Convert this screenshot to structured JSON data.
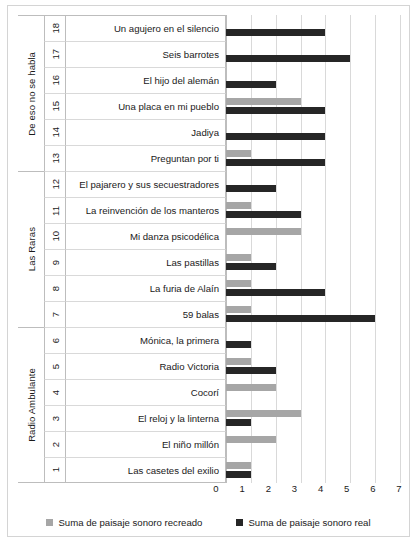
{
  "chart_data": {
    "type": "bar",
    "orientation": "horizontal",
    "title": "",
    "xlabel": "",
    "ylabel": "",
    "xlim": [
      0,
      7
    ],
    "xticks": [
      0,
      1,
      2,
      3,
      4,
      5,
      6,
      7
    ],
    "grid": true,
    "legend_position": "bottom",
    "legend": [
      "Suma de paisaje sonoro recreado",
      "Suma de paisaje sonoro real"
    ],
    "colors": {
      "recreado": "#a6a6a6",
      "real": "#262626",
      "grid": "#d9d9d9",
      "border": "#bdbdbd",
      "background": "#ffffff",
      "text": "#1a1a1a"
    },
    "series": [
      {
        "name": "Suma de paisaje sonoro recreado",
        "color": "#a6a6a6",
        "values": [
          1,
          2,
          3,
          2,
          1,
          0,
          1,
          1,
          1,
          3,
          1,
          0,
          1,
          0,
          3,
          0,
          0,
          0
        ]
      },
      {
        "name": "Suma de paisaje sonoro real",
        "color": "#262626",
        "values": [
          1,
          0,
          1,
          0,
          2,
          1,
          6,
          4,
          2,
          0,
          3,
          2,
          4,
          4,
          4,
          2,
          5,
          4
        ]
      }
    ],
    "categories": [
      "Las casetes del exilio",
      "El niño millón",
      "El reloj y la linterna",
      "Cocorí",
      "Radio Victoria",
      "Mónica, la primera",
      "59 balas",
      "La furia de Alaín",
      "Las pastillas",
      "Mi danza psicodélica",
      "La reinvención de los manteros",
      "El pajarero y sus secuestradores",
      "Preguntan por ti",
      "Jadiya",
      "Una placa en mi pueblo",
      "El hijo del alemán",
      "Seis barrotes",
      "Un agujero en el silencio"
    ],
    "numbers": [
      1,
      2,
      3,
      4,
      5,
      6,
      7,
      8,
      9,
      10,
      11,
      12,
      13,
      14,
      15,
      16,
      17,
      18
    ],
    "groups": [
      {
        "label": "De eso no se habla",
        "start_number": 13,
        "end_number": 18
      },
      {
        "label": "Las Raras",
        "start_number": 7,
        "end_number": 12
      },
      {
        "label": "Radio Ambulante",
        "start_number": 1,
        "end_number": 6
      }
    ]
  },
  "rows": [
    {
      "number": "18",
      "category": "Un agujero en el silencio",
      "recreado": 0,
      "real": 4,
      "group": "De eso no se habla"
    },
    {
      "number": "17",
      "category": "Seis barrotes",
      "recreado": 0,
      "real": 5,
      "group": "De eso no se habla"
    },
    {
      "number": "16",
      "category": "El hijo del alemán",
      "recreado": 0,
      "real": 2,
      "group": "De eso no se habla"
    },
    {
      "number": "15",
      "category": "Una placa en mi pueblo",
      "recreado": 3,
      "real": 4,
      "group": "De eso no se habla"
    },
    {
      "number": "14",
      "category": "Jadiya",
      "recreado": 0,
      "real": 4,
      "group": "De eso no se habla"
    },
    {
      "number": "13",
      "category": "Preguntan por ti",
      "recreado": 1,
      "real": 4,
      "group": "De eso no se habla"
    },
    {
      "number": "12",
      "category": "El pajarero y sus secuestradores",
      "recreado": 0,
      "real": 2,
      "group": "Las Raras"
    },
    {
      "number": "11",
      "category": "La reinvención de los manteros",
      "recreado": 1,
      "real": 3,
      "group": "Las Raras"
    },
    {
      "number": "10",
      "category": "Mi danza psicodélica",
      "recreado": 3,
      "real": 0,
      "group": "Las Raras"
    },
    {
      "number": "9",
      "category": "Las pastillas",
      "recreado": 1,
      "real": 2,
      "group": "Las Raras"
    },
    {
      "number": "8",
      "category": "La furia de Alaín",
      "recreado": 1,
      "real": 4,
      "group": "Las Raras"
    },
    {
      "number": "7",
      "category": "59 balas",
      "recreado": 1,
      "real": 6,
      "group": "Las Raras"
    },
    {
      "number": "6",
      "category": "Mónica, la primera",
      "recreado": 0,
      "real": 1,
      "group": "Radio Ambulante"
    },
    {
      "number": "5",
      "category": "Radio Victoria",
      "recreado": 1,
      "real": 2,
      "group": "Radio Ambulante"
    },
    {
      "number": "4",
      "category": "Cocorí",
      "recreado": 2,
      "real": 0,
      "group": "Radio Ambulante"
    },
    {
      "number": "3",
      "category": "El reloj y la linterna",
      "recreado": 3,
      "real": 1,
      "group": "Radio Ambulante"
    },
    {
      "number": "2",
      "category": "El niño millón",
      "recreado": 2,
      "real": 0,
      "group": "Radio Ambulante"
    },
    {
      "number": "1",
      "category": "Las casetes del exilio",
      "recreado": 1,
      "real": 1,
      "group": "Radio Ambulante"
    }
  ],
  "groups_display": [
    {
      "label": "De eso no se habla",
      "rows": 6
    },
    {
      "label": "Las Raras",
      "rows": 6
    },
    {
      "label": "Radio Ambulante",
      "rows": 6
    }
  ],
  "axis": {
    "ticks": [
      "0",
      "1",
      "2",
      "3",
      "4",
      "5",
      "6",
      "7"
    ]
  },
  "legend": {
    "recreado_label": "Suma de paisaje sonoro recreado",
    "real_label": "Suma de paisaje sonoro real"
  }
}
